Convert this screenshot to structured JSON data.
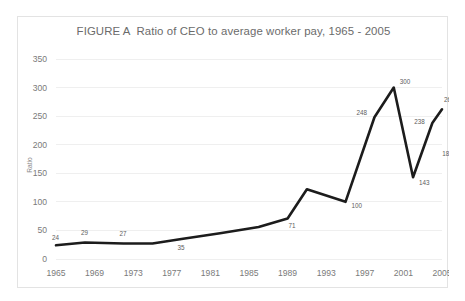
{
  "chart_data": {
    "type": "line",
    "title": "FIGURE A  Ratio of CEO to average worker pay, 1965 - 2005",
    "xlabel": "",
    "ylabel": "Ratio",
    "xlim": [
      1965,
      2005
    ],
    "ylim": [
      0,
      350
    ],
    "grid": true,
    "legend": "none",
    "line_color": "#1c1c1c",
    "x_ticks": [
      1965,
      1969,
      1973,
      1977,
      1981,
      1985,
      1989,
      1993,
      1997,
      2001,
      2005
    ],
    "y_ticks": [
      0,
      50,
      100,
      150,
      200,
      250,
      300,
      350
    ],
    "x": [
      1965,
      1968,
      1972,
      1975,
      1978,
      1982,
      1986,
      1989,
      1991,
      1995,
      1998,
      2000,
      2002,
      2004,
      2005
    ],
    "values": [
      24,
      29,
      27,
      27,
      35,
      45,
      56,
      71,
      122,
      100,
      248,
      300,
      143,
      238,
      262
    ],
    "point_labels": [
      {
        "x": 1965,
        "y": 24,
        "text": "24",
        "dx": -4,
        "dy": -5
      },
      {
        "x": 1968,
        "y": 29,
        "text": "29",
        "dx": -4,
        "dy": -7
      },
      {
        "x": 1972,
        "y": 27,
        "text": "27",
        "dx": -4,
        "dy": -8
      },
      {
        "x": 1978,
        "y": 35,
        "text": "35",
        "dx": -4,
        "dy": 11
      },
      {
        "x": 1989,
        "y": 71,
        "text": "71",
        "dx": 1,
        "dy": 10
      },
      {
        "x": 1995,
        "y": 100,
        "text": "100",
        "dx": 6,
        "dy": 6
      },
      {
        "x": 1998,
        "y": 248,
        "text": "248",
        "dx": -18,
        "dy": -2
      },
      {
        "x": 2000,
        "y": 300,
        "text": "300",
        "dx": 6,
        "dy": -4
      },
      {
        "x": 2002,
        "y": 143,
        "text": "143",
        "dx": 6,
        "dy": 8
      },
      {
        "x": 2004,
        "y": 238,
        "text": "238",
        "dx": -18,
        "dy": 1
      },
      {
        "x": 2004.3,
        "y": 181,
        "text": "181",
        "dx": 7,
        "dy": 0
      },
      {
        "x": 2005,
        "y": 262,
        "text": "262",
        "dx": 2,
        "dy": -7
      }
    ]
  },
  "axes": {
    "y_axis_title": "Ratio"
  }
}
